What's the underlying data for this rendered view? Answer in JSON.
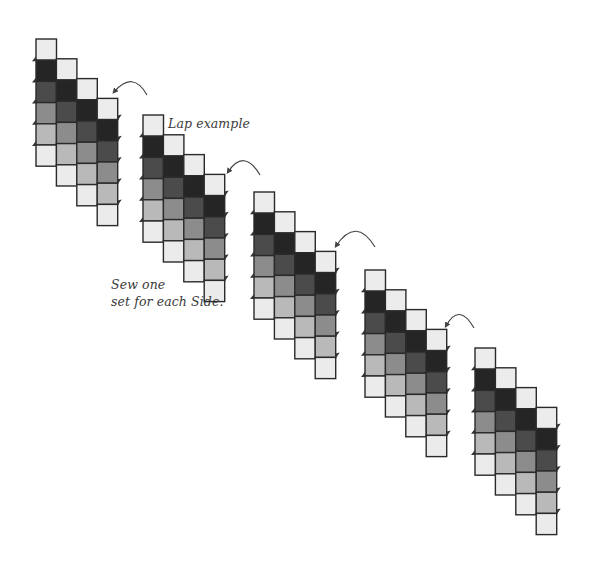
{
  "labels": {
    "lap_example": "Lap example",
    "sew_line1": "Sew one",
    "sew_line2": "set for each Side."
  },
  "colors": {
    "outline": "#2a2a2a",
    "arrow": "#444444",
    "shades": [
      "#ececec",
      "#252525",
      "#4b4b4b",
      "#8c8c8c",
      "#b9b9b9",
      "#ebebeb"
    ]
  },
  "square": {
    "width": 20.5,
    "height": 21.2
  },
  "column_offset": {
    "dx": 20.4,
    "dy": 19.8
  },
  "strip": {
    "columns": 4,
    "rows_per_column": 6,
    "column_shade_order": [
      [
        0,
        1,
        2,
        3,
        4,
        5
      ],
      [
        0,
        1,
        2,
        3,
        4,
        5
      ],
      [
        0,
        1,
        2,
        3,
        4,
        5
      ],
      [
        0,
        1,
        2,
        3,
        4,
        5
      ]
    ]
  },
  "strips": [
    {
      "name": "strip-1",
      "x": 36,
      "y": 39
    },
    {
      "name": "strip-2",
      "x": 143,
      "y": 115
    },
    {
      "name": "strip-3",
      "x": 254,
      "y": 192
    },
    {
      "name": "strip-4",
      "x": 365,
      "y": 270
    },
    {
      "name": "strip-5",
      "x": 475,
      "y": 348
    }
  ],
  "arrows": [
    {
      "name": "rotate-arrow-1",
      "start": [
        147,
        95
      ],
      "ctrl": [
        133,
        70
      ],
      "end": [
        114,
        92
      ]
    },
    {
      "name": "rotate-arrow-2",
      "start": [
        260,
        175
      ],
      "ctrl": [
        244,
        148
      ],
      "end": [
        228,
        172
      ]
    },
    {
      "name": "rotate-arrow-3",
      "start": [
        375,
        247
      ],
      "ctrl": [
        356,
        216
      ],
      "end": [
        336,
        246
      ]
    },
    {
      "name": "rotate-arrow-4",
      "start": [
        474,
        328
      ],
      "ctrl": [
        459,
        302
      ],
      "end": [
        446,
        326
      ]
    }
  ]
}
